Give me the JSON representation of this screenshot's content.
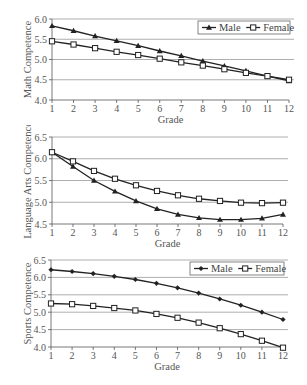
{
  "chart_data": [
    {
      "type": "line",
      "title": "",
      "xlabel": "Grade",
      "ylabel": "Math Competence",
      "categories": [
        1,
        2,
        3,
        4,
        5,
        6,
        7,
        8,
        9,
        10,
        11,
        12
      ],
      "yticks": [
        "4.0",
        "4.5",
        "5.0",
        "5.5",
        "6.0"
      ],
      "ylim": [
        4.0,
        6.0
      ],
      "grid": true,
      "legend_position": "upper-right",
      "series": [
        {
          "name": "Male",
          "marker": "triangle",
          "values": [
            5.83,
            5.71,
            5.58,
            5.46,
            5.34,
            5.21,
            5.09,
            4.96,
            4.84,
            4.72,
            4.59,
            4.47
          ]
        },
        {
          "name": "Female",
          "marker": "square",
          "values": [
            5.45,
            5.37,
            5.28,
            5.19,
            5.11,
            5.02,
            4.93,
            4.85,
            4.76,
            4.67,
            4.59,
            4.5
          ]
        }
      ]
    },
    {
      "type": "line",
      "title": "",
      "xlabel": "Grade",
      "ylabel": "Language Arts Competence",
      "categories": [
        1,
        2,
        3,
        4,
        5,
        6,
        7,
        8,
        9,
        10,
        11,
        12
      ],
      "yticks": [
        "4.5",
        "5.0",
        "5.5",
        "6.0",
        "6.5"
      ],
      "ylim": [
        4.5,
        6.5
      ],
      "grid": true,
      "legend_position": "none",
      "series": [
        {
          "name": "Male",
          "marker": "triangle",
          "values": [
            6.15,
            5.82,
            5.5,
            5.25,
            5.03,
            4.85,
            4.72,
            4.64,
            4.6,
            4.6,
            4.63,
            4.72
          ]
        },
        {
          "name": "Female",
          "marker": "square",
          "values": [
            6.15,
            5.94,
            5.72,
            5.54,
            5.39,
            5.26,
            5.16,
            5.08,
            5.03,
            4.99,
            4.98,
            4.99
          ]
        }
      ]
    },
    {
      "type": "line",
      "title": "",
      "xlabel": "Grade",
      "ylabel": "Sports Competence",
      "categories": [
        1,
        2,
        3,
        4,
        5,
        6,
        7,
        8,
        9,
        10,
        11,
        12
      ],
      "yticks": [
        "4.0",
        "4.5",
        "5.0",
        "5.5",
        "6.0",
        "6.5"
      ],
      "ylim": [
        4.0,
        6.5
      ],
      "grid": true,
      "legend_position": "upper-right",
      "series": [
        {
          "name": "Male",
          "marker": "diamond",
          "values": [
            6.22,
            6.17,
            6.11,
            6.03,
            5.94,
            5.83,
            5.7,
            5.55,
            5.38,
            5.2,
            5.0,
            4.79
          ]
        },
        {
          "name": "Female",
          "marker": "square",
          "values": [
            5.25,
            5.23,
            5.18,
            5.12,
            5.05,
            4.95,
            4.84,
            4.7,
            4.54,
            4.37,
            4.18,
            3.98
          ]
        }
      ]
    }
  ],
  "layout": [
    {
      "top": 0,
      "height": 125,
      "x0": 52,
      "x1": 289,
      "y_top": 19,
      "y_bottom": 100,
      "legend": {
        "x": 198,
        "y": 21,
        "w": 92,
        "h": 13
      }
    },
    {
      "top": 125,
      "height": 130,
      "x0": 52,
      "x1": 283,
      "y_top": 12,
      "y_bottom": 99,
      "legend": null
    },
    {
      "top": 255,
      "height": 130,
      "x0": 51,
      "x1": 283,
      "y_top": 5,
      "y_bottom": 92,
      "legend": {
        "x": 190,
        "y": 7,
        "w": 94,
        "h": 13
      }
    }
  ],
  "colors": {
    "line": "#222222",
    "grid": "#999999",
    "axis": "#555555",
    "text": "#555555"
  }
}
